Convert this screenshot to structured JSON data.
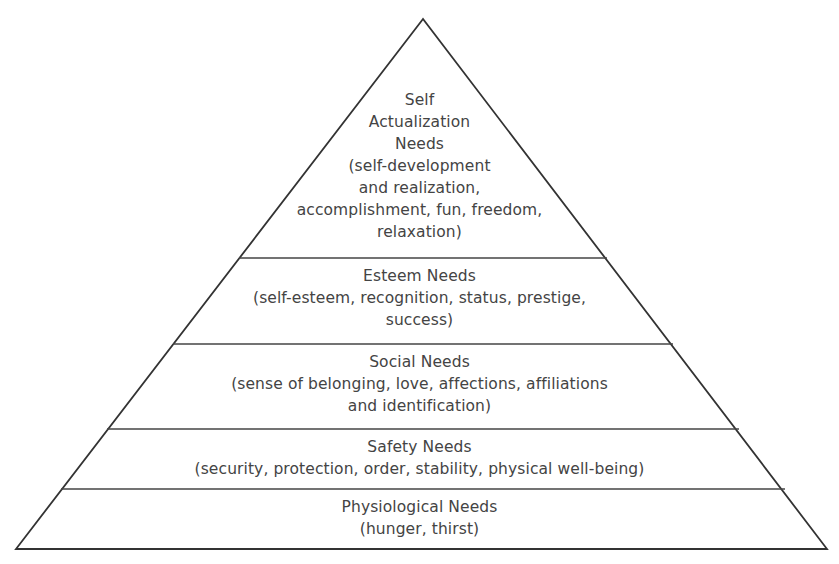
{
  "diagram": {
    "type": "pyramid",
    "colors": {
      "stroke": "#333333",
      "text": "#444444",
      "background": "#ffffff"
    },
    "levels": [
      {
        "id": "self-actualization",
        "title_lines": [
          "Self",
          "Actualization",
          "Needs"
        ],
        "detail_lines": [
          "(self-development",
          "and realization,",
          "accomplishment, fun, freedom,",
          "relaxation)"
        ]
      },
      {
        "id": "esteem",
        "title_lines": [
          "Esteem Needs"
        ],
        "detail_lines": [
          "(self-esteem, recognition, status, prestige,",
          "success)"
        ]
      },
      {
        "id": "social",
        "title_lines": [
          "Social Needs"
        ],
        "detail_lines": [
          "(sense of belonging, love, affections, affiliations",
          "and identification)"
        ]
      },
      {
        "id": "safety",
        "title_lines": [
          "Safety Needs"
        ],
        "detail_lines": [
          "(security, protection, order, stability, physical well-being)"
        ]
      },
      {
        "id": "physiological",
        "title_lines": [
          "Physiological Needs"
        ],
        "detail_lines": [
          "(hunger, thirst)"
        ]
      }
    ]
  }
}
